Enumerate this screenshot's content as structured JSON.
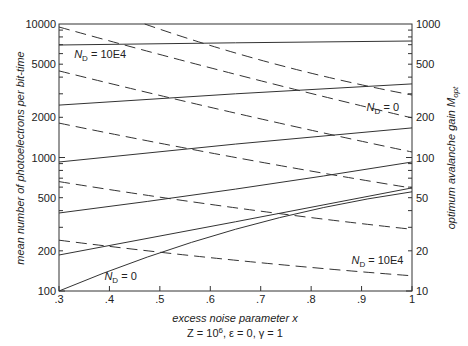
{
  "chart_data": {
    "type": "line",
    "title": "",
    "xlabel": "excess noise parameter x",
    "subtitle": "Z = 10^6, ε = 0, γ = 1",
    "ylabel_left": "mean number of photoelectrons per bit-time",
    "ylabel_right": "optimum avalanche gain M_opt",
    "x_ticks": [
      ".3",
      ".4",
      ".5",
      ".6",
      ".7",
      ".8",
      ".9",
      "1"
    ],
    "x_tick_values": [
      0.3,
      0.4,
      0.5,
      0.6,
      0.7,
      0.8,
      0.9,
      1.0
    ],
    "xlim": [
      0.3,
      1.0
    ],
    "ylim_left": [
      100,
      10000
    ],
    "ylim_right": [
      10,
      1000
    ],
    "yscale": "log",
    "y_ticks_left": [
      "100",
      "200",
      "500",
      "1000",
      "2000",
      "5000",
      "10000"
    ],
    "y_tick_values_left": [
      100,
      200,
      500,
      1000,
      2000,
      5000,
      10000
    ],
    "y_ticks_right": [
      "10",
      "20",
      "50",
      "100",
      "200",
      "500",
      "1000"
    ],
    "y_tick_values_right": [
      10,
      20,
      50,
      100,
      200,
      500,
      1000
    ],
    "grid": false,
    "annotations": [
      {
        "text": "N_D = 10E4",
        "x": 0.33,
        "y_left": 6000
      },
      {
        "text": "N_D = 0",
        "x": 0.91,
        "y_right": 240
      },
      {
        "text": "N_D = 0",
        "x": 0.39,
        "y_left": 130
      },
      {
        "text": "N_D = 10E4",
        "x": 0.88,
        "y_right": 17
      }
    ],
    "series": [
      {
        "name": "photoelectrons N_D=10E4",
        "style": "solid",
        "axis": "left",
        "x": [
          0.3,
          0.65,
          1.0
        ],
        "values": [
          6960,
          7230,
          7460
        ]
      },
      {
        "name": "photoelectrons series 2",
        "style": "solid",
        "axis": "left",
        "x": [
          0.3,
          0.65,
          1.0
        ],
        "values": [
          2470,
          3000,
          3560
        ]
      },
      {
        "name": "photoelectrons series 3",
        "style": "solid",
        "axis": "left",
        "x": [
          0.3,
          0.65,
          1.0
        ],
        "values": [
          925,
          1260,
          1665
        ]
      },
      {
        "name": "photoelectrons series 4",
        "style": "solid",
        "axis": "left",
        "x": [
          0.3,
          0.65,
          1.0
        ],
        "values": [
          384,
          580,
          925
        ]
      },
      {
        "name": "photoelectrons series 5",
        "style": "solid",
        "axis": "left",
        "x": [
          0.3,
          0.65,
          1.0
        ],
        "values": [
          186,
          330,
          592
        ]
      },
      {
        "name": "photoelectrons N_D=0",
        "style": "solid",
        "axis": "left",
        "x": [
          0.3,
          0.65,
          1.0
        ],
        "values": [
          100,
          290,
          553
        ]
      },
      {
        "name": "gain N_D=0",
        "style": "dashed",
        "axis": "right",
        "x": [
          0.47,
          0.73,
          1.0
        ],
        "values": [
          1000,
          500,
          294
        ]
      },
      {
        "name": "gain series 2",
        "style": "dashed",
        "axis": "right",
        "x": [
          0.3,
          0.65,
          1.0
        ],
        "values": [
          950,
          420,
          198
        ]
      },
      {
        "name": "gain series 3",
        "style": "dashed",
        "axis": "right",
        "x": [
          0.3,
          0.65,
          1.0
        ],
        "values": [
          445,
          215,
          110
        ]
      },
      {
        "name": "gain series 4",
        "style": "dashed",
        "axis": "right",
        "x": [
          0.3,
          0.65,
          1.0
        ],
        "values": [
          181,
          100,
          59
        ]
      },
      {
        "name": "gain series 5",
        "style": "dashed",
        "axis": "right",
        "x": [
          0.3,
          0.65,
          1.0
        ],
        "values": [
          66,
          42,
          29
        ]
      },
      {
        "name": "gain N_D=10E4",
        "style": "dashed",
        "axis": "right",
        "x": [
          0.3,
          0.65,
          1.0
        ],
        "values": [
          24,
          17,
          13
        ]
      }
    ]
  }
}
